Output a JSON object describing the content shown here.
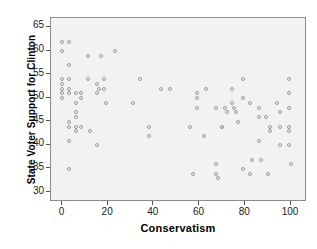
{
  "chart_data": {
    "type": "scatter",
    "title": "",
    "xlabel": "Conservatism",
    "ylabel": "State Voter Support for Clinton",
    "xlim": [
      -5,
      107
    ],
    "ylim": [
      28,
      67
    ],
    "xticks": [
      0,
      20,
      40,
      60,
      80,
      100
    ],
    "yticks": [
      30,
      35,
      40,
      45,
      50,
      55,
      60,
      65
    ],
    "grid": false,
    "legend": null,
    "marker": "open-circle",
    "marker_color": "#9a9a9a",
    "plot_background": "#f2f2f2",
    "points": [
      {
        "x": 0,
        "y": 62
      },
      {
        "x": 0,
        "y": 60
      },
      {
        "x": 0,
        "y": 54
      },
      {
        "x": 0,
        "y": 53
      },
      {
        "x": 0,
        "y": 52
      },
      {
        "x": 0,
        "y": 51
      },
      {
        "x": 0,
        "y": 50
      },
      {
        "x": 3,
        "y": 62
      },
      {
        "x": 3,
        "y": 57
      },
      {
        "x": 3,
        "y": 54
      },
      {
        "x": 3,
        "y": 52
      },
      {
        "x": 3,
        "y": 51
      },
      {
        "x": 3,
        "y": 45
      },
      {
        "x": 3,
        "y": 44
      },
      {
        "x": 3,
        "y": 41
      },
      {
        "x": 3,
        "y": 35
      },
      {
        "x": 6,
        "y": 51
      },
      {
        "x": 6,
        "y": 49
      },
      {
        "x": 6,
        "y": 47
      },
      {
        "x": 6,
        "y": 46
      },
      {
        "x": 6,
        "y": 44
      },
      {
        "x": 6,
        "y": 43
      },
      {
        "x": 8,
        "y": 51
      },
      {
        "x": 8,
        "y": 50
      },
      {
        "x": 8,
        "y": 44
      },
      {
        "x": 11,
        "y": 59
      },
      {
        "x": 11,
        "y": 54
      },
      {
        "x": 12,
        "y": 43
      },
      {
        "x": 15,
        "y": 53
      },
      {
        "x": 15,
        "y": 51
      },
      {
        "x": 15,
        "y": 40
      },
      {
        "x": 16,
        "y": 52
      },
      {
        "x": 17,
        "y": 59
      },
      {
        "x": 18,
        "y": 54
      },
      {
        "x": 18,
        "y": 52
      },
      {
        "x": 19,
        "y": 49
      },
      {
        "x": 23,
        "y": 60
      },
      {
        "x": 31,
        "y": 49
      },
      {
        "x": 34,
        "y": 54
      },
      {
        "x": 38,
        "y": 44
      },
      {
        "x": 38,
        "y": 42
      },
      {
        "x": 43,
        "y": 52
      },
      {
        "x": 47,
        "y": 52
      },
      {
        "x": 56,
        "y": 44
      },
      {
        "x": 57,
        "y": 34
      },
      {
        "x": 59,
        "y": 51
      },
      {
        "x": 59,
        "y": 50
      },
      {
        "x": 59,
        "y": 48
      },
      {
        "x": 62,
        "y": 42
      },
      {
        "x": 63,
        "y": 52
      },
      {
        "x": 67,
        "y": 36
      },
      {
        "x": 67,
        "y": 48
      },
      {
        "x": 67,
        "y": 34
      },
      {
        "x": 68,
        "y": 33
      },
      {
        "x": 70,
        "y": 44
      },
      {
        "x": 70,
        "y": 44
      },
      {
        "x": 71,
        "y": 48
      },
      {
        "x": 72,
        "y": 47
      },
      {
        "x": 74,
        "y": 49
      },
      {
        "x": 74,
        "y": 52
      },
      {
        "x": 75,
        "y": 48
      },
      {
        "x": 76,
        "y": 47
      },
      {
        "x": 77,
        "y": 45
      },
      {
        "x": 79,
        "y": 54
      },
      {
        "x": 79,
        "y": 50
      },
      {
        "x": 79,
        "y": 35
      },
      {
        "x": 82,
        "y": 49
      },
      {
        "x": 82,
        "y": 34
      },
      {
        "x": 83,
        "y": 37
      },
      {
        "x": 86,
        "y": 48
      },
      {
        "x": 86,
        "y": 46
      },
      {
        "x": 86,
        "y": 41
      },
      {
        "x": 87,
        "y": 37
      },
      {
        "x": 89,
        "y": 46
      },
      {
        "x": 90,
        "y": 34
      },
      {
        "x": 91,
        "y": 44
      },
      {
        "x": 91,
        "y": 43
      },
      {
        "x": 94,
        "y": 49
      },
      {
        "x": 95,
        "y": 47
      },
      {
        "x": 95,
        "y": 44
      },
      {
        "x": 95,
        "y": 40
      },
      {
        "x": 99,
        "y": 54
      },
      {
        "x": 99,
        "y": 51
      },
      {
        "x": 99,
        "y": 48
      },
      {
        "x": 99,
        "y": 44
      },
      {
        "x": 99,
        "y": 43
      },
      {
        "x": 99,
        "y": 40
      },
      {
        "x": 100,
        "y": 36
      }
    ]
  }
}
